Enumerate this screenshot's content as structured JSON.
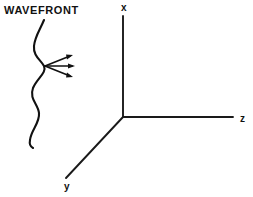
{
  "figure": {
    "title_label": "WAVEFRONT",
    "background_color": "#ffffff",
    "ink_color": "#111111",
    "width": 253,
    "height": 197
  },
  "axes": {
    "origin": {
      "x": 123,
      "y": 117
    },
    "items": [
      {
        "name": "x",
        "label": "x",
        "label_x": 121,
        "label_y": 11,
        "end_x": 123,
        "end_y": 16,
        "direction": "up"
      },
      {
        "name": "y",
        "label": "y",
        "label_x": 64,
        "label_y": 190,
        "end_x": 66,
        "end_y": 178,
        "direction": "down-left"
      },
      {
        "name": "z",
        "label": "z",
        "label_x": 240,
        "label_y": 122,
        "end_x": 233,
        "end_y": 117,
        "direction": "right"
      }
    ]
  },
  "wavefront": {
    "label": "WAVEFRONT",
    "label_x": 4,
    "label_y": 14,
    "curve_path": "M 44 20 C 40 30, 35 36, 34 46 C 33 56, 41 60, 44 66 C 47 73, 37 78, 33 88 C 29 99, 38 104, 39 113 C 40 123, 31 130, 30 140 C 29 145, 31 147, 33 148",
    "description": "wavy vertical wavefront curve"
  },
  "rays": {
    "origin": {
      "x": 45,
      "y": 66
    },
    "count": 3,
    "items": [
      {
        "name": "ray-upper",
        "tip_x": 73,
        "tip_y": 55
      },
      {
        "name": "ray-middle",
        "tip_x": 75,
        "tip_y": 66
      },
      {
        "name": "ray-lower",
        "tip_x": 73,
        "tip_y": 77
      }
    ]
  }
}
